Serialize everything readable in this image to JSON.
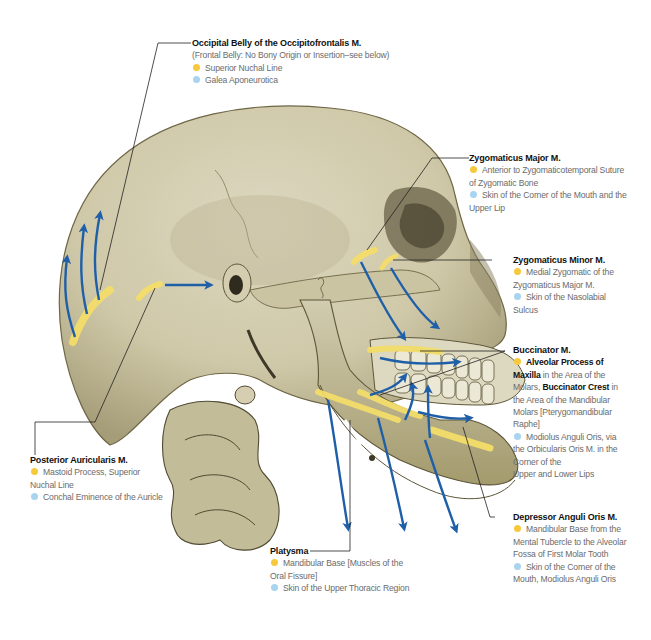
{
  "legend_colors": {
    "origin": "#f6c93c",
    "insertion": "#a9d4ef",
    "arrow": "#1f5fa8",
    "bone": "#d6d0b5",
    "muscle_strip": "#f3dd6a"
  },
  "labels": {
    "occipital": {
      "title": "Occipital Belly of the Occipitofrontalis M.",
      "note": "(Frontal Belly: No Bony Origin or Insertion–see below)",
      "origin": "Superior Nuchal Line",
      "insertion": "Galea Aponeurotica"
    },
    "zygomaticus_major": {
      "title": "Zygomaticus Major M.",
      "origin_1": "Anterior to Zygomaticotemporal Suture",
      "origin_2": "of Zygomatic Bone",
      "insertion_1": "Skin of the Corner of the Mouth and the",
      "insertion_2": "Upper Lip"
    },
    "zygomaticus_minor": {
      "title": "Zygomaticus Minor M.",
      "origin_1": "Medial Zygomatic of the",
      "origin_2": "Zygomaticus Major M.",
      "insertion_1": "Skin of the Nasolabial",
      "insertion_2": "Sulcus"
    },
    "buccinator": {
      "title": "Buccinator M.",
      "origin_bold_1": "Alveolar Process of",
      "origin_bold_2": "Maxilla",
      "origin_text_1": " in the Area of the",
      "origin_text_2": "Molars, ",
      "origin_bold_3": "Buccinator Crest",
      "origin_text_3": " in",
      "origin_text_4": "the Area of the Mandibular",
      "origin_text_5": "Molars [Pterygomandibular",
      "origin_text_6": "Raphe]",
      "insertion_1": "Modiolus Anguli Oris, via",
      "insertion_2": "the Orbicularis Oris M. in the",
      "insertion_3": "Corner of the",
      "insertion_4": "Upper and Lower Lips"
    },
    "posterior_auricularis": {
      "title": "Posterior Auricularis M.",
      "origin_1": "Mastoid Process, Superior",
      "origin_2": "Nuchal Line",
      "insertion": "Conchal Eminence of the Auricle"
    },
    "platysma": {
      "title": "Platysma",
      "origin_1": "Mandibular Base [Muscles of the",
      "origin_2": "Oral Fissure]",
      "insertion": "Skin of the Upper Thoracic Region"
    },
    "depressor_anguli_oris": {
      "title": "Depressor Anguli Oris M.",
      "origin_1": "Mandibular Base from the",
      "origin_2": "Mental Tubercle to the Alveolar",
      "origin_3": "Fossa of First Molar Tooth",
      "insertion_1": "Skin of the Corner of the",
      "insertion_2": "Mouth, Modiolus Anguli Oris"
    }
  }
}
